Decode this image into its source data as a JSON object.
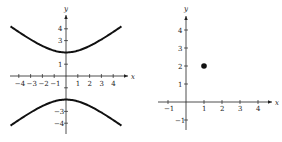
{
  "chart_data": [
    {
      "type": "line",
      "title": "",
      "xlabel": "x",
      "ylabel": "y",
      "xlim": [
        -4.5,
        4.5
      ],
      "ylim": [
        -4.5,
        4.5
      ],
      "x_ticks": [
        "-4",
        "-3",
        "-2",
        "-1",
        "1",
        "2",
        "3",
        "4"
      ],
      "y_ticks": [
        "4",
        "3",
        "1",
        "-3",
        "-4"
      ],
      "series": [
        {
          "name": "upper branch",
          "equation": "y = sqrt(x^2/4 + 4)... hyperbola vertex (0,2)",
          "vertex": [
            0,
            2
          ]
        },
        {
          "name": "lower branch",
          "vertex": [
            0,
            -2
          ]
        }
      ],
      "grid": false
    },
    {
      "type": "scatter",
      "title": "",
      "xlabel": "x",
      "ylabel": "y",
      "xlim": [
        -1.5,
        4.5
      ],
      "ylim": [
        -1.5,
        4.5
      ],
      "x_ticks": [
        "-1",
        "1",
        "2",
        "3",
        "4"
      ],
      "y_ticks": [
        "4",
        "3",
        "2",
        "1",
        "-1"
      ],
      "points": [
        [
          1,
          2
        ]
      ],
      "grid": false
    }
  ],
  "left": {
    "xlabel": "x",
    "ylabel": "y",
    "xticks": [
      {
        "v": -4,
        "t": "-4"
      },
      {
        "v": -3,
        "t": "-3"
      },
      {
        "v": -2,
        "t": "-2"
      },
      {
        "v": -1,
        "t": "-1"
      },
      {
        "v": 1,
        "t": "1"
      },
      {
        "v": 2,
        "t": "2"
      },
      {
        "v": 3,
        "t": "3"
      },
      {
        "v": 4,
        "t": "4"
      }
    ],
    "yticks": [
      {
        "v": 4,
        "t": "4"
      },
      {
        "v": 3,
        "t": "3"
      },
      {
        "v": 1,
        "t": "1"
      },
      {
        "v": -1,
        "t": ""
      },
      {
        "v": -3,
        "t": "-3"
      },
      {
        "v": -4,
        "t": "-4"
      }
    ]
  },
  "right": {
    "xlabel": "x",
    "ylabel": "y",
    "xticks": [
      {
        "v": -1,
        "t": "-1"
      },
      {
        "v": 1,
        "t": "1"
      },
      {
        "v": 2,
        "t": "2"
      },
      {
        "v": 3,
        "t": "3"
      },
      {
        "v": 4,
        "t": "4"
      }
    ],
    "yticks": [
      {
        "v": 4,
        "t": "4"
      },
      {
        "v": 3,
        "t": "3"
      },
      {
        "v": 2,
        "t": "2"
      },
      {
        "v": 1,
        "t": "1"
      },
      {
        "v": -1,
        "t": "-1"
      }
    ],
    "point": [
      1,
      2
    ]
  }
}
